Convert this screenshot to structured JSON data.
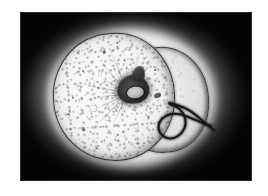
{
  "page": {
    "background_color": "#ffffff",
    "width": 268,
    "height": 196
  },
  "photo": {
    "name": "photomicrograph",
    "alt_text": "Grayscale photomicrograph of a rounded translucent egg-like specimen with a dark micropyle and a long curved filament, lit from behind against a black field",
    "frame": {
      "left": 20,
      "top": 12,
      "width": 232,
      "height": 169,
      "background_color": "#050505",
      "border_color": "#a0a0a0"
    },
    "palette": {
      "background": "#050505",
      "halo": "#ffffff",
      "specimen_body": "#fafafa",
      "specimen_outline": "#2e2e2e",
      "micropyle": "#1e1e1e",
      "filament": "#161616",
      "paper": "#ffffff"
    },
    "subject": {
      "label": "specimen",
      "body_label": "main-chamber",
      "lobe_label": "secondary-lobe",
      "micropyle_label": "micropyle",
      "filament_label": "filament"
    }
  },
  "geometry": {
    "striation_count": 34,
    "inclusions": [
      {
        "left": 52,
        "top": 16,
        "size": 2.6
      },
      {
        "left": 30,
        "top": 34,
        "size": 2.0
      },
      {
        "left": 72,
        "top": 26,
        "size": 2.2
      },
      {
        "left": 18,
        "top": 60,
        "size": 2.4
      },
      {
        "left": 44,
        "top": 52,
        "size": 1.8
      },
      {
        "left": 86,
        "top": 48,
        "size": 2.1
      },
      {
        "left": 26,
        "top": 92,
        "size": 2.5
      },
      {
        "left": 60,
        "top": 100,
        "size": 2.0
      },
      {
        "left": 92,
        "top": 84,
        "size": 1.9
      },
      {
        "left": 12,
        "top": 76,
        "size": 2.2
      },
      {
        "left": 66,
        "top": 8,
        "size": 1.7
      },
      {
        "left": 38,
        "top": 112,
        "size": 2.0
      },
      {
        "left": 80,
        "top": 110,
        "size": 1.8
      },
      {
        "left": 102,
        "top": 38,
        "size": 1.6
      }
    ],
    "vesicles": [
      {
        "left": 36,
        "top": 70,
        "size": 5.5
      },
      {
        "left": 50,
        "top": 82,
        "size": 4.2
      },
      {
        "left": 64,
        "top": 66,
        "size": 3.6
      },
      {
        "left": 24,
        "top": 50,
        "size": 3.2
      },
      {
        "left": 78,
        "top": 92,
        "size": 3.8
      },
      {
        "left": 46,
        "top": 38,
        "size": 3.0
      }
    ],
    "filament_path": "M 150 92 C 157 94, 163 99, 165 106 C 167 113, 164 120, 158 124 C 152 128, 145 127, 141 122 C 137 117, 138 110, 143 106 C 149 101, 158 101, 166 104 C 176 108, 184 112, 191 114",
    "filament_path_2": "M 149 91 C 160 93, 170 98, 177 104 C 184 110, 189 115, 194 118"
  }
}
